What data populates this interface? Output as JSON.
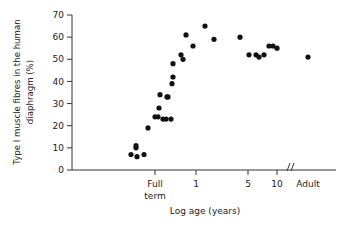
{
  "chart_data": {
    "type": "scatter",
    "title": "",
    "xlabel": "Log age (years)",
    "ylabel": "Type I muscle fibres in the human diaphragm (%)",
    "ylabel_line1": "Type I muscle fibres in the human",
    "ylabel_line2": "diaphragm (%)",
    "grid": false,
    "legend": false,
    "ylim": [
      0,
      70
    ],
    "yticks": [
      0,
      10,
      20,
      30,
      40,
      50,
      60,
      70
    ],
    "ytick_labels": [
      "0",
      "10",
      "20",
      "30",
      "40",
      "50",
      "60",
      "70"
    ],
    "xtick_labels": [
      "Full term",
      "1",
      "5",
      "10",
      "Adult"
    ],
    "xtick_label_full_line1": "Full",
    "xtick_label_full_line2": "term",
    "xtick_positions_px": [
      155,
      196,
      248,
      277,
      308
    ],
    "axis_break": {
      "present": true,
      "symbol": "//",
      "position_px": 287
    },
    "marker": "filled-circle",
    "marker_color": "#111111",
    "n_points": 33,
    "points": [
      {
        "x_px": 131,
        "y_pct": 7
      },
      {
        "x_px": 136,
        "y_pct": 11
      },
      {
        "x_px": 136,
        "y_pct": 10
      },
      {
        "x_px": 137,
        "y_pct": 6
      },
      {
        "x_px": 144,
        "y_pct": 7
      },
      {
        "x_px": 148,
        "y_pct": 19
      },
      {
        "x_px": 155,
        "y_pct": 24
      },
      {
        "x_px": 158,
        "y_pct": 24
      },
      {
        "x_px": 159,
        "y_pct": 28
      },
      {
        "x_px": 160,
        "y_pct": 34
      },
      {
        "x_px": 163,
        "y_pct": 23
      },
      {
        "x_px": 166,
        "y_pct": 23
      },
      {
        "x_px": 167,
        "y_pct": 33
      },
      {
        "x_px": 168,
        "y_pct": 33
      },
      {
        "x_px": 171,
        "y_pct": 23
      },
      {
        "x_px": 172,
        "y_pct": 39
      },
      {
        "x_px": 173,
        "y_pct": 42
      },
      {
        "x_px": 173,
        "y_pct": 48
      },
      {
        "x_px": 181,
        "y_pct": 52
      },
      {
        "x_px": 183,
        "y_pct": 50
      },
      {
        "x_px": 186,
        "y_pct": 61
      },
      {
        "x_px": 193,
        "y_pct": 56
      },
      {
        "x_px": 205,
        "y_pct": 65
      },
      {
        "x_px": 214,
        "y_pct": 59
      },
      {
        "x_px": 240,
        "y_pct": 60
      },
      {
        "x_px": 249,
        "y_pct": 52
      },
      {
        "x_px": 256,
        "y_pct": 52
      },
      {
        "x_px": 259,
        "y_pct": 51
      },
      {
        "x_px": 264,
        "y_pct": 52
      },
      {
        "x_px": 269,
        "y_pct": 56
      },
      {
        "x_px": 273,
        "y_pct": 56
      },
      {
        "x_px": 277,
        "y_pct": 55
      },
      {
        "x_px": 308,
        "y_pct": 51
      }
    ]
  }
}
